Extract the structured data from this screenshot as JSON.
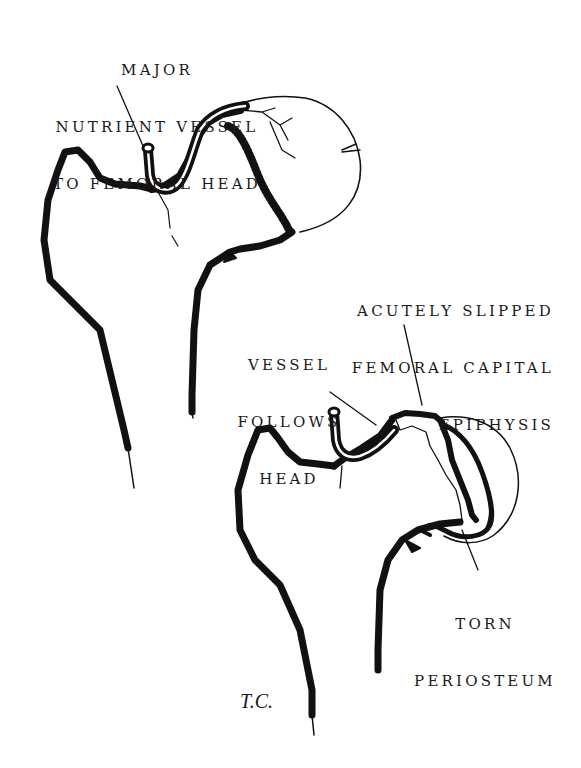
{
  "figure": {
    "top_drawing": {
      "label": {
        "lines": [
          "MAJOR",
          "NUTRIENT VESSEL",
          "TO FEMORAL HEAD"
        ]
      }
    },
    "bottom_drawing": {
      "labels": {
        "slipped": {
          "lines": [
            "ACUTELY SLIPPED",
            "FEMORAL CAPITAL",
            "EPIPHYSIS"
          ]
        },
        "vessel": {
          "lines": [
            "VESSEL",
            "FOLLOWS",
            "HEAD"
          ]
        },
        "periosteum": {
          "lines": [
            "TORN",
            "PERIOSTEUM"
          ]
        }
      }
    },
    "signature": "T.C.",
    "colors": {
      "ink": "#111111",
      "paper": "#ffffff"
    }
  }
}
